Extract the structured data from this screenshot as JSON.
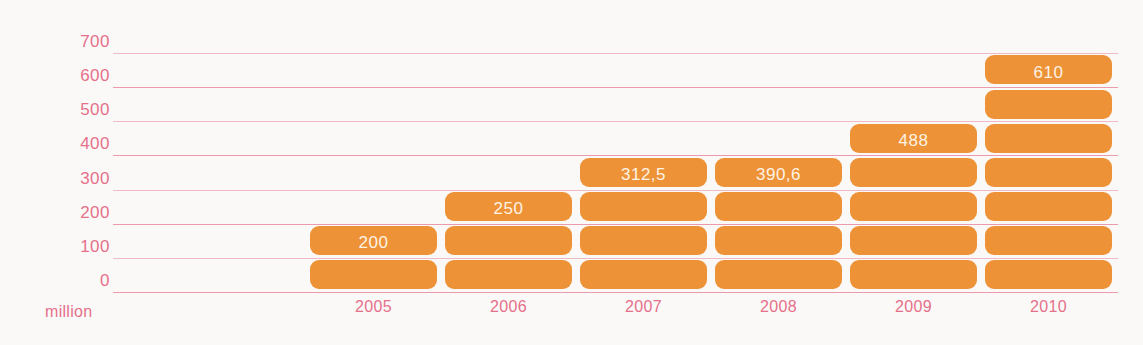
{
  "chart_data": {
    "type": "bar",
    "title": "",
    "subtitle": "",
    "xlabel": "",
    "ylabel": "million",
    "unit_caption": "million",
    "categories": [
      "2005",
      "2006",
      "2007",
      "2008",
      "2009",
      "2010"
    ],
    "values": [
      200,
      250,
      312.5,
      390.6,
      488,
      610
    ],
    "value_labels": [
      "200",
      "250",
      "312,5",
      "390,6",
      "488",
      "610"
    ],
    "ylim": [
      0,
      700
    ],
    "yticks": [
      0,
      100,
      200,
      300,
      400,
      500,
      600,
      700
    ],
    "ytick_labels": [
      "0",
      "100",
      "200",
      "300",
      "400",
      "500",
      "600",
      "700"
    ],
    "grid": true,
    "legend": false,
    "legend_position": "none",
    "series": [
      {
        "name": "million",
        "values": [
          200,
          250,
          312.5,
          390.6,
          488,
          610
        ]
      }
    ],
    "style": {
      "bar_color": "#EE9237",
      "value_label_color": "#FDF3E4",
      "axis_label_color": "#E5708A",
      "gridline_color": "#F0B9C6",
      "background_color": "#FBF9F8",
      "bar_style": "segmented-stacked-rounded",
      "segment_unit": 100
    }
  }
}
